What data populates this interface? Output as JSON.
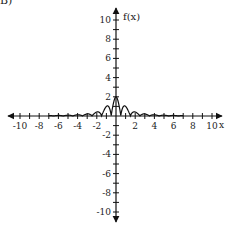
{
  "problem_label": "B)",
  "chart_data": {
    "type": "line",
    "title": "",
    "xlabel": "x",
    "ylabel": "f(x)",
    "xlim": [
      -11,
      11
    ],
    "ylim": [
      -11,
      11
    ],
    "grid": false,
    "x_ticks": [
      -10,
      -8,
      -6,
      -4,
      -2,
      2,
      4,
      6,
      8,
      10
    ],
    "y_ticks": [
      -10,
      -8,
      -6,
      -4,
      -2,
      2,
      4,
      6,
      8,
      10
    ],
    "x_tick_labels": [
      "-10",
      "-8",
      "-6",
      "-4",
      "-2",
      "2",
      "4",
      "6",
      "8",
      "10"
    ],
    "y_tick_labels": [
      "-10",
      "-8",
      "-6",
      "-4",
      "-2",
      "2",
      "4",
      "6",
      "8",
      "10"
    ],
    "key_points": [
      {
        "x": 0,
        "y": 2
      },
      {
        "x": -1,
        "y": 1
      },
      {
        "x": 1,
        "y": 1
      },
      {
        "x": -2,
        "y": 0.4
      },
      {
        "x": 2,
        "y": 0.4
      },
      {
        "x": -3,
        "y": 0.25
      },
      {
        "x": 3,
        "y": 0.2
      }
    ]
  }
}
